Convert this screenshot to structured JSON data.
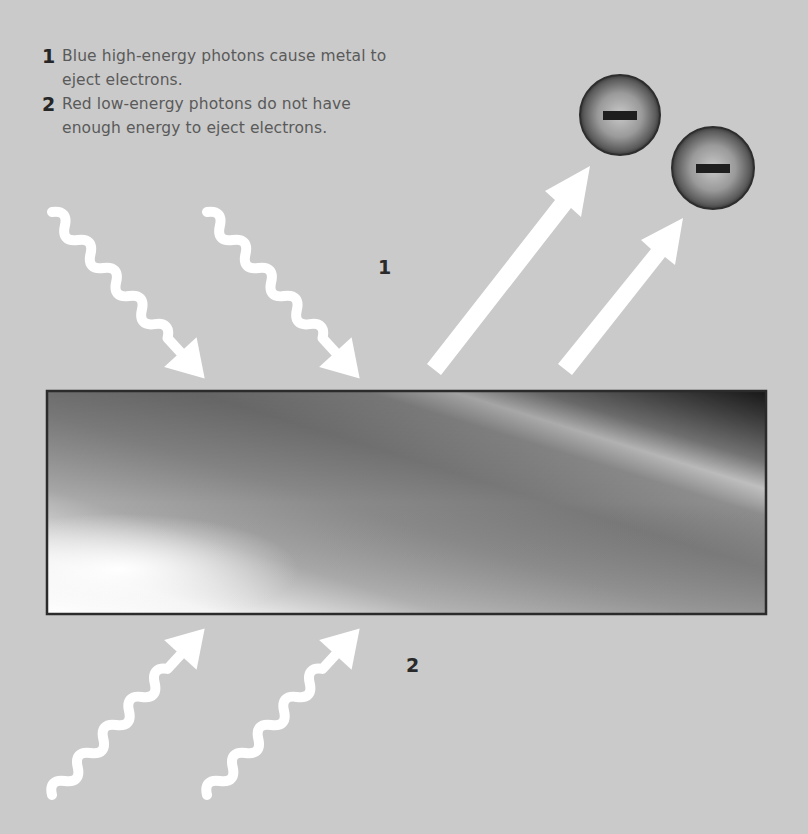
{
  "legend": {
    "items": [
      {
        "number": "1",
        "text": "Blue high-energy photons cause metal to eject electrons."
      },
      {
        "number": "2",
        "text": "Red low-energy photons do not have enough energy to eject electrons."
      }
    ]
  },
  "labels": {
    "top": "1",
    "bottom": "2"
  },
  "electrons": [
    {
      "symbol": "minus",
      "charge": "-"
    },
    {
      "symbol": "minus",
      "charge": "-"
    }
  ],
  "colors": {
    "background": "#cacaca",
    "photon": "#ffffff",
    "electron_arrow": "#ffffff",
    "plate_border": "#2b2b2b",
    "text": "#5a5a5a",
    "number": "#262626"
  }
}
